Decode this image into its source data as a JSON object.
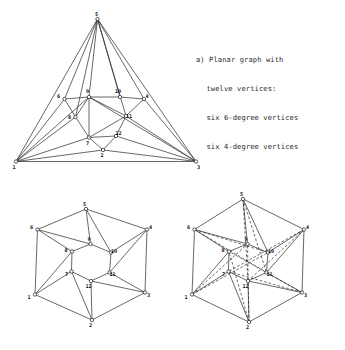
{
  "figure": {
    "background_color": "#ffffff",
    "ink_color": "#262626",
    "caption": {
      "label": "a)",
      "lines": [
        "a) Planar graph with",
        "twelve vertices:",
        "six 6-degree vertices",
        "six 4-degree vertices"
      ],
      "full_text": "a) Planar graph with twelve vertices: six 6-degree vertices six 4-degree vertices"
    },
    "vertex_labels": [
      "1",
      "2",
      "3",
      "4",
      "5",
      "6",
      "7",
      "8",
      "9",
      "10",
      "11",
      "12"
    ],
    "panels": [
      {
        "name": "planar-embedding-triangle",
        "style": "solid",
        "nodes": [
          {
            "id": "5",
            "x": 97.5,
            "y": 19.0,
            "label": "5",
            "label_dx": -1.0,
            "label_dy": -3.5
          },
          {
            "id": "1",
            "x": 16.0,
            "y": 161.5,
            "label": "1",
            "label_dx": -2.0,
            "label_dy": 7.0
          },
          {
            "id": "3",
            "x": 196.0,
            "y": 161.5,
            "label": "3",
            "label_dx": 2.5,
            "label_dy": 7.0
          },
          {
            "id": "6",
            "x": 64.5,
            "y": 99.0,
            "label": "6",
            "label_dx": -6.0,
            "label_dy": -1.5
          },
          {
            "id": "9",
            "x": 89.0,
            "y": 97.0,
            "label": "9",
            "label_dx": -1.5,
            "label_dy": -4.0
          },
          {
            "id": "10",
            "x": 120.0,
            "y": 97.0,
            "label": "10",
            "label_dx": -2.0,
            "label_dy": -4.0
          },
          {
            "id": "4",
            "x": 144.0,
            "y": 99.0,
            "label": "4",
            "label_dx": 3.0,
            "label_dy": -1.5
          },
          {
            "id": "8",
            "x": 75.5,
            "y": 117.0,
            "label": "8",
            "label_dx": -6.0,
            "label_dy": 1.5
          },
          {
            "id": "11",
            "x": 126.0,
            "y": 116.0,
            "label": "11",
            "label_dx": 3.0,
            "label_dy": 2.0
          },
          {
            "id": "7",
            "x": 89.0,
            "y": 137.5,
            "label": "7",
            "label_dx": -1.5,
            "label_dy": 7.0
          },
          {
            "id": "12",
            "x": 116.0,
            "y": 136.0,
            "label": "12",
            "label_dx": 2.5,
            "label_dy": -1.0
          },
          {
            "id": "2",
            "x": 103.0,
            "y": 150.0,
            "label": "2",
            "label_dx": -1.0,
            "label_dy": 7.0
          }
        ],
        "edges": [
          [
            "5",
            "1"
          ],
          [
            "5",
            "3"
          ],
          [
            "1",
            "3"
          ],
          [
            "5",
            "6"
          ],
          [
            "5",
            "9"
          ],
          [
            "5",
            "10"
          ],
          [
            "5",
            "4"
          ],
          [
            "1",
            "6"
          ],
          [
            "1",
            "8"
          ],
          [
            "1",
            "7"
          ],
          [
            "1",
            "2"
          ],
          [
            "3",
            "4"
          ],
          [
            "3",
            "11"
          ],
          [
            "3",
            "12"
          ],
          [
            "3",
            "2"
          ],
          [
            "6",
            "9"
          ],
          [
            "9",
            "10"
          ],
          [
            "10",
            "4"
          ],
          [
            "6",
            "8"
          ],
          [
            "8",
            "7"
          ],
          [
            "7",
            "12"
          ],
          [
            "12",
            "11"
          ],
          [
            "11",
            "4"
          ],
          [
            "9",
            "8"
          ],
          [
            "9",
            "7"
          ],
          [
            "9",
            "11"
          ],
          [
            "7",
            "11"
          ],
          [
            "7",
            "2"
          ],
          [
            "2",
            "12"
          ],
          [
            "1",
            "9"
          ],
          [
            "3",
            "9"
          ],
          [
            "5",
            "11"
          ],
          [
            "5",
            "8"
          ]
        ]
      },
      {
        "name": "hexagonal-embedding",
        "style": "solid",
        "nodes": [
          {
            "id": "5",
            "x": 86.0,
            "y": 209.0,
            "label": "5",
            "label_dx": -1.5,
            "label_dy": -3.5
          },
          {
            "id": "6",
            "x": 37.5,
            "y": 229.5,
            "label": "6",
            "label_dx": -6.0,
            "label_dy": -1.0
          },
          {
            "id": "4",
            "x": 147.0,
            "y": 229.5,
            "label": "4",
            "label_dx": 3.5,
            "label_dy": -1.0
          },
          {
            "id": "1",
            "x": 35.0,
            "y": 294.5,
            "label": "1",
            "label_dx": -6.0,
            "label_dy": 4.0
          },
          {
            "id": "3",
            "x": 145.0,
            "y": 292.5,
            "label": "3",
            "label_dx": 3.5,
            "label_dy": 4.0
          },
          {
            "id": "2",
            "x": 92.0,
            "y": 320.0,
            "label": "2",
            "label_dx": -1.5,
            "label_dy": 7.0
          },
          {
            "id": "9",
            "x": 90.5,
            "y": 244.0,
            "label": "9",
            "label_dx": -1.5,
            "label_dy": -3.5
          },
          {
            "id": "10",
            "x": 111.0,
            "y": 252.5,
            "label": "10",
            "label_dx": 3.0,
            "label_dy": 0.5
          },
          {
            "id": "8",
            "x": 72.0,
            "y": 251.5,
            "label": "8",
            "label_dx": -6.0,
            "label_dy": 0.0
          },
          {
            "id": "11",
            "x": 109.5,
            "y": 272.5,
            "label": "11",
            "label_dx": 3.0,
            "label_dy": 3.5
          },
          {
            "id": "7",
            "x": 71.5,
            "y": 271.5,
            "label": "7",
            "label_dx": -5.0,
            "label_dy": 4.5
          },
          {
            "id": "12",
            "x": 91.0,
            "y": 281.0,
            "label": "12",
            "label_dx": -2.5,
            "label_dy": 7.0
          }
        ],
        "edges": [
          [
            "5",
            "6"
          ],
          [
            "6",
            "1"
          ],
          [
            "1",
            "2"
          ],
          [
            "2",
            "3"
          ],
          [
            "3",
            "4"
          ],
          [
            "4",
            "5"
          ],
          [
            "9",
            "10"
          ],
          [
            "10",
            "11"
          ],
          [
            "11",
            "12"
          ],
          [
            "12",
            "7"
          ],
          [
            "7",
            "8"
          ],
          [
            "8",
            "9"
          ],
          [
            "5",
            "9"
          ],
          [
            "5",
            "10"
          ],
          [
            "6",
            "9"
          ],
          [
            "6",
            "8"
          ],
          [
            "4",
            "10"
          ],
          [
            "4",
            "11"
          ],
          [
            "1",
            "8"
          ],
          [
            "1",
            "7"
          ],
          [
            "3",
            "11"
          ],
          [
            "3",
            "12"
          ],
          [
            "2",
            "7"
          ],
          [
            "2",
            "12"
          ]
        ]
      },
      {
        "name": "hexagonal-embedding-with-dashed-overlay",
        "style": "solid-and-dashed",
        "nodes": [
          {
            "id": "5",
            "x": 243.0,
            "y": 199.0,
            "label": "5",
            "label_dx": -1.5,
            "label_dy": -3.0
          },
          {
            "id": "6",
            "x": 194.5,
            "y": 229.5,
            "label": "6",
            "label_dx": -6.0,
            "label_dy": -1.0
          },
          {
            "id": "4",
            "x": 304.0,
            "y": 229.5,
            "label": "4",
            "label_dx": 3.5,
            "label_dy": -1.0
          },
          {
            "id": "1",
            "x": 192.0,
            "y": 294.5,
            "label": "1",
            "label_dx": -6.0,
            "label_dy": 4.0
          },
          {
            "id": "3",
            "x": 302.0,
            "y": 292.5,
            "label": "3",
            "label_dx": 3.5,
            "label_dy": 4.0
          },
          {
            "id": "2",
            "x": 249.0,
            "y": 322.0,
            "label": "2",
            "label_dx": -1.5,
            "label_dy": 7.0
          },
          {
            "id": "9",
            "x": 247.5,
            "y": 244.0,
            "label": "9",
            "label_dx": -1.5,
            "label_dy": -3.5
          },
          {
            "id": "10",
            "x": 268.0,
            "y": 252.5,
            "label": "10",
            "label_dx": 3.0,
            "label_dy": 0.5
          },
          {
            "id": "8",
            "x": 229.0,
            "y": 251.5,
            "label": "8",
            "label_dx": -6.0,
            "label_dy": 0.0
          },
          {
            "id": "11",
            "x": 266.5,
            "y": 272.5,
            "label": "11",
            "label_dx": 3.0,
            "label_dy": 3.5
          },
          {
            "id": "7",
            "x": 228.5,
            "y": 271.5,
            "label": "7",
            "label_dx": -5.0,
            "label_dy": 4.5
          },
          {
            "id": "12",
            "x": 248.0,
            "y": 281.0,
            "label": "12",
            "label_dx": -2.5,
            "label_dy": 7.0
          }
        ],
        "edges": [
          [
            "5",
            "6"
          ],
          [
            "6",
            "1"
          ],
          [
            "1",
            "2"
          ],
          [
            "2",
            "3"
          ],
          [
            "3",
            "4"
          ],
          [
            "4",
            "5"
          ],
          [
            "9",
            "10"
          ],
          [
            "10",
            "11"
          ],
          [
            "11",
            "12"
          ],
          [
            "12",
            "7"
          ],
          [
            "7",
            "8"
          ],
          [
            "8",
            "9"
          ],
          [
            "5",
            "9"
          ],
          [
            "5",
            "10"
          ],
          [
            "6",
            "9"
          ],
          [
            "6",
            "8"
          ],
          [
            "4",
            "10"
          ],
          [
            "4",
            "11"
          ],
          [
            "1",
            "8"
          ],
          [
            "1",
            "7"
          ],
          [
            "3",
            "11"
          ],
          [
            "3",
            "12"
          ],
          [
            "2",
            "7"
          ],
          [
            "2",
            "12"
          ]
        ],
        "dashed_edges": [
          [
            "6",
            "10"
          ],
          [
            "6",
            "11"
          ],
          [
            "5",
            "11"
          ],
          [
            "5",
            "12"
          ],
          [
            "4",
            "12"
          ],
          [
            "4",
            "7"
          ],
          [
            "3",
            "7"
          ],
          [
            "3",
            "8"
          ],
          [
            "2",
            "8"
          ],
          [
            "2",
            "9"
          ],
          [
            "1",
            "9"
          ],
          [
            "1",
            "10"
          ]
        ]
      }
    ]
  }
}
